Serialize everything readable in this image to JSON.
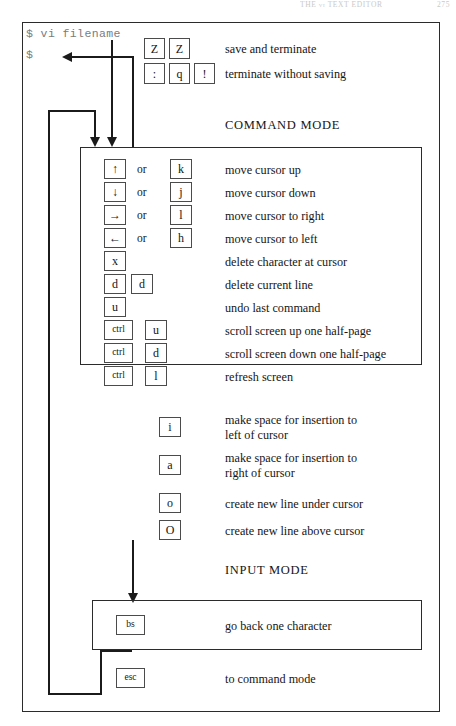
{
  "running_head": {
    "title": "THE vi TEXT EDITOR",
    "page_number": "275"
  },
  "terminal": {
    "line1": "$ vi filename",
    "line2": "$"
  },
  "captions": {
    "command_mode": "COMMAND MODE",
    "input_mode": "INPUT MODE"
  },
  "exit_commands": [
    {
      "keys": [
        "Z",
        "Z"
      ],
      "description": "save and terminate"
    },
    {
      "keys": [
        ":",
        "q",
        "!"
      ],
      "description": "terminate without saving"
    }
  ],
  "command_mode_rows": [
    {
      "key1": "↑",
      "connector": "or",
      "key2": "k",
      "description": "move cursor up"
    },
    {
      "key1": "↓",
      "connector": "or",
      "key2": "j",
      "description": "move cursor down"
    },
    {
      "key1": "→",
      "connector": "or",
      "key2": "l",
      "description": "move cursor to right"
    },
    {
      "key1": "←",
      "connector": "or",
      "key2": "h",
      "description": "move cursor to left"
    },
    {
      "key1": "x",
      "connector": "",
      "key2": "",
      "description": "delete character at cursor"
    },
    {
      "key1": "d",
      "connector": "",
      "key2": "d",
      "description": "delete current line"
    },
    {
      "key1": "u",
      "connector": "",
      "key2": "",
      "description": "undo last command"
    },
    {
      "key1": "ctrl",
      "connector": "",
      "key2": "u",
      "description": "scroll screen up one half-page"
    },
    {
      "key1": "ctrl",
      "connector": "",
      "key2": "d",
      "description": "scroll screen down one half-page"
    },
    {
      "key1": "ctrl",
      "connector": "",
      "key2": "l",
      "description": "refresh screen"
    }
  ],
  "insert_rows": [
    {
      "key": "i",
      "description_line1": "make space for insertion to",
      "description_line2": "left of cursor"
    },
    {
      "key": "a",
      "description_line1": "make space for insertion to",
      "description_line2": "right of cursor"
    },
    {
      "key": "o",
      "description_line1": "create new line under cursor",
      "description_line2": ""
    },
    {
      "key": "O",
      "description_line1": "create new line above cursor",
      "description_line2": ""
    }
  ],
  "input_mode_rows": [
    {
      "key": "bs",
      "description": "go back one character"
    }
  ],
  "escape_row": {
    "key": "esc",
    "description": "to command mode"
  },
  "colors": {
    "ink": "#151515",
    "rule": "#2b2b2b",
    "terminal_text": "#7b7b7b",
    "page_background": "#ffffff"
  }
}
